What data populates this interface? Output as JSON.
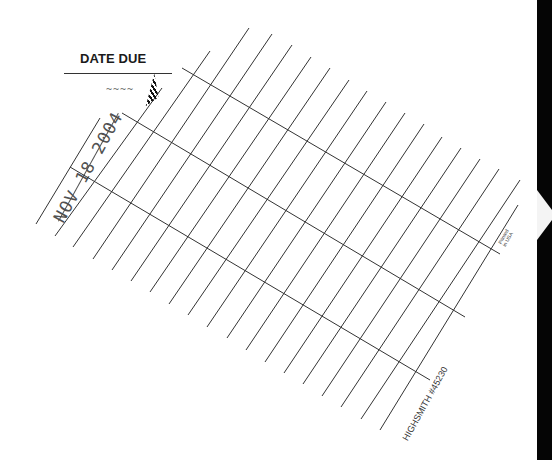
{
  "card": {
    "title": "DATE DUE",
    "stamped_date": "NOV 18 2004",
    "partial_stamp_top": "~~~~",
    "printed_note_line1": "Printed",
    "printed_note_line2": "in USA",
    "footer": "HIGHSMITH #45230"
  },
  "colors": {
    "background": "#ffffff",
    "ink": "#333333",
    "edge": "#050505"
  },
  "grid": {
    "diagonal_lines": [
      {
        "x1": 100,
        "y1": 118,
        "x2": 36,
        "y2": 224
      },
      {
        "x1": 162,
        "y1": 88,
        "x2": 55,
        "y2": 236
      },
      {
        "x1": 210,
        "y1": 51,
        "x2": 73,
        "y2": 247
      },
      {
        "x1": 249,
        "y1": 28,
        "x2": 93,
        "y2": 259
      },
      {
        "x1": 272,
        "y1": 34,
        "x2": 112,
        "y2": 270
      },
      {
        "x1": 292,
        "y1": 45,
        "x2": 131,
        "y2": 281
      },
      {
        "x1": 311,
        "y1": 57,
        "x2": 150,
        "y2": 292
      },
      {
        "x1": 330,
        "y1": 68,
        "x2": 169,
        "y2": 304
      },
      {
        "x1": 349,
        "y1": 80,
        "x2": 188,
        "y2": 315
      },
      {
        "x1": 367,
        "y1": 91,
        "x2": 207,
        "y2": 327
      },
      {
        "x1": 386,
        "y1": 102,
        "x2": 227,
        "y2": 338
      },
      {
        "x1": 405,
        "y1": 113,
        "x2": 246,
        "y2": 350
      },
      {
        "x1": 424,
        "y1": 124,
        "x2": 265,
        "y2": 362
      },
      {
        "x1": 442,
        "y1": 137,
        "x2": 284,
        "y2": 373
      },
      {
        "x1": 461,
        "y1": 148,
        "x2": 303,
        "y2": 384
      },
      {
        "x1": 480,
        "y1": 159,
        "x2": 322,
        "y2": 396
      },
      {
        "x1": 499,
        "y1": 169,
        "x2": 341,
        "y2": 407
      },
      {
        "x1": 520,
        "y1": 180,
        "x2": 361,
        "y2": 419
      },
      {
        "x1": 518,
        "y1": 205,
        "x2": 380,
        "y2": 430
      }
    ],
    "cross_lines": [
      {
        "x1": 182,
        "y1": 68,
        "x2": 500,
        "y2": 254
      },
      {
        "x1": 122,
        "y1": 113,
        "x2": 465,
        "y2": 317
      },
      {
        "x1": 70,
        "y1": 167,
        "x2": 430,
        "y2": 380
      }
    ]
  }
}
